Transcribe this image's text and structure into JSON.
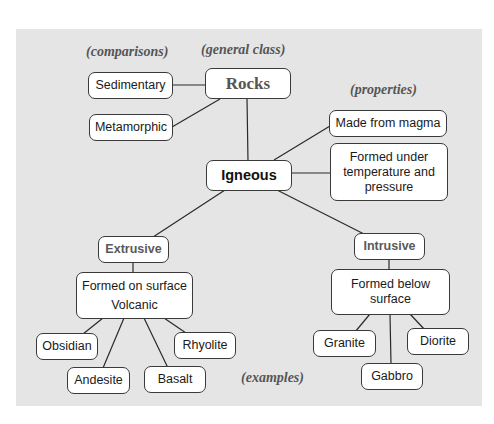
{
  "diagram": {
    "type": "concept-map",
    "background_color": "#e5e5e5",
    "labels": {
      "comparisons": "(comparisons)",
      "general_class": "(general class)",
      "properties": "(properties)",
      "examples": "(examples)"
    },
    "nodes": {
      "rocks": "Rocks",
      "sedimentary": "Sedimentary",
      "metamorphic": "Metamorphic",
      "igneous": "Igneous",
      "made_from_magma": "Made from magma",
      "formed_under_l1": "Formed under",
      "formed_under_l2": "temperature and",
      "formed_under_l3": "pressure",
      "extrusive": "Extrusive",
      "intrusive": "Intrusive",
      "formed_on_surface": "Formed on surface",
      "volcanic": "Volcanic",
      "formed_below_l1": "Formed below",
      "formed_below_l2": "surface",
      "obsidian": "Obsidian",
      "andesite": "Andesite",
      "basalt": "Basalt",
      "rhyolite": "Rhyolite",
      "granite": "Granite",
      "gabbro": "Gabbro",
      "diorite": "Diorite"
    },
    "edges": [
      [
        "Sedimentary",
        "Rocks"
      ],
      [
        "Metamorphic",
        "Rocks"
      ],
      [
        "Rocks",
        "Igneous"
      ],
      [
        "Igneous",
        "Made from magma"
      ],
      [
        "Igneous",
        "Formed under temperature and pressure"
      ],
      [
        "Igneous",
        "Extrusive"
      ],
      [
        "Igneous",
        "Intrusive"
      ],
      [
        "Extrusive",
        "Formed on surface Volcanic"
      ],
      [
        "Intrusive",
        "Formed below surface"
      ],
      [
        "Formed on surface Volcanic",
        "Obsidian"
      ],
      [
        "Formed on surface Volcanic",
        "Andesite"
      ],
      [
        "Formed on surface Volcanic",
        "Basalt"
      ],
      [
        "Formed on surface Volcanic",
        "Rhyolite"
      ],
      [
        "Formed below surface",
        "Granite"
      ],
      [
        "Formed below surface",
        "Gabbro"
      ],
      [
        "Formed below surface",
        "Diorite"
      ]
    ]
  }
}
